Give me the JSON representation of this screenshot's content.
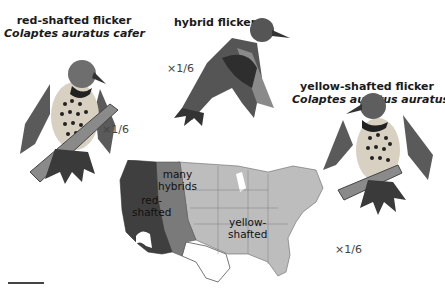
{
  "birds": {
    "red": {
      "common": "red-shafted flicker",
      "scientific": "Colaptes auratus cafer",
      "scale": "×1/6"
    },
    "hybrid": {
      "common": "hybrid flicker",
      "scale": "×1/6"
    },
    "yellow": {
      "common": "yellow-shafted flicker",
      "scientific": "Colaptes auratus auratus",
      "scale": "×1/6"
    }
  },
  "map": {
    "regions": [
      {
        "id": "red",
        "label_line1": "red-",
        "label_line2": "shafted",
        "color": "#3f3f3f"
      },
      {
        "id": "hybrid",
        "label_line1": "many",
        "label_line2": "hybrids",
        "color": "#7a7a7a"
      },
      {
        "id": "yellow",
        "label_line1": "yellow-",
        "label_line2": "shafted",
        "color": "#bdbdbd"
      }
    ]
  },
  "colors": {
    "dark": "#3f3f3f",
    "mid": "#7a7a7a",
    "light": "#bdbdbd",
    "outline": "#555555"
  }
}
